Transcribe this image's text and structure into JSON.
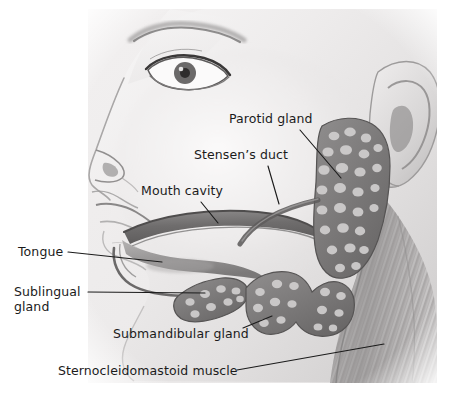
{
  "figure": {
    "medium": "grayscale pencil / halftone anatomical illustration",
    "background_color": "#ffffff",
    "plate_tint": "#eceaea",
    "ink_color": "#1b1b1b",
    "width": 454,
    "height": 396
  },
  "labels": [
    {
      "id": "parotid-gland",
      "text": "Parotid gland",
      "x": 229,
      "y": 112,
      "leader": {
        "x1": 300,
        "y1": 130,
        "x2": 341,
        "y2": 178
      }
    },
    {
      "id": "stensens-duct",
      "text": "Stensen’s duct",
      "x": 194,
      "y": 148,
      "leader": {
        "x1": 268,
        "y1": 166,
        "x2": 279,
        "y2": 204
      }
    },
    {
      "id": "mouth-cavity",
      "text": "Mouth cavity",
      "x": 141,
      "y": 184,
      "leader": {
        "x1": 201,
        "y1": 202,
        "x2": 218,
        "y2": 223
      }
    },
    {
      "id": "tongue",
      "text": "Tongue",
      "x": 18,
      "y": 245,
      "leader": {
        "x1": 68,
        "y1": 252,
        "x2": 162,
        "y2": 262
      }
    },
    {
      "id": "sublingual-gland",
      "text": "Sublingual\ngland",
      "x": 14,
      "y": 285,
      "leader": {
        "x1": 88,
        "y1": 292,
        "x2": 205,
        "y2": 293
      }
    },
    {
      "id": "submandibular-gland",
      "text": "Submandibular gland",
      "x": 113,
      "y": 327,
      "leader": {
        "x1": 243,
        "y1": 328,
        "x2": 272,
        "y2": 316
      }
    },
    {
      "id": "sternocleidomastoid-muscle",
      "text": "Sternocleidomastoid muscle",
      "x": 58,
      "y": 364,
      "leader": {
        "x1": 237,
        "y1": 370,
        "x2": 384,
        "y2": 344
      }
    }
  ],
  "anatomy_parts": [
    "eyebrow",
    "eye",
    "nose",
    "upper-lip",
    "lower-lip",
    "chin",
    "cheek",
    "ear",
    "mouth-cavity",
    "tongue",
    "parotid-gland",
    "stensens-duct",
    "sublingual-gland",
    "submandibular-gland",
    "sternocleidomastoid-muscle"
  ]
}
